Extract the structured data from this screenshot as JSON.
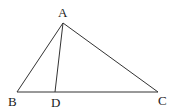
{
  "diagram": {
    "type": "triangle",
    "stroke_color": "#333333",
    "points": {
      "A": {
        "label": "A",
        "x": 63,
        "y": 23,
        "lx": 58,
        "ly": 17
      },
      "B": {
        "label": "B",
        "x": 17,
        "y": 92,
        "lx": 8,
        "ly": 106
      },
      "D": {
        "label": "D",
        "x": 55,
        "y": 92,
        "lx": 51,
        "ly": 107
      },
      "C": {
        "label": "C",
        "x": 158,
        "y": 92,
        "lx": 158,
        "ly": 105
      }
    },
    "segments": [
      [
        "A",
        "B"
      ],
      [
        "A",
        "C"
      ],
      [
        "B",
        "C"
      ],
      [
        "A",
        "D"
      ]
    ]
  }
}
